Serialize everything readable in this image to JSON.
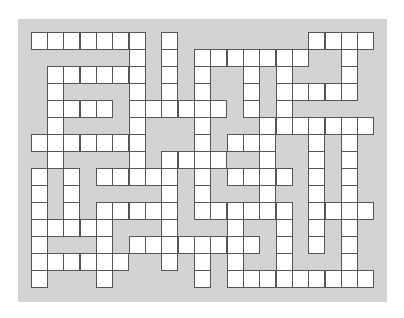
{
  "puzzle": {
    "type": "crossword-grid",
    "columns": 21,
    "rows": 15,
    "colors": {
      "page_background": "#ffffff",
      "panel_background": "#d3d3d3",
      "open_cell": "#ffffff",
      "cell_border": "#555555"
    },
    "grid": [
      "111111101000000001111",
      "000000101011111110010",
      "011111101010010100010",
      "010000101010010111110",
      "011110111111010100000",
      "010000100010001111111",
      "111111100010111001010",
      "010000101111001001010",
      "101011111010111101010",
      "101000001010001001010",
      "101011111011111101111",
      "111110001000100101010",
      "100010111111110101010",
      "111111001010100100010",
      "100010000010111111111"
    ]
  }
}
